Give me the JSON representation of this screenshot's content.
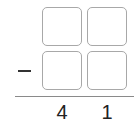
{
  "problem": {
    "operator": "−",
    "operator_name": "minus",
    "top_row": [
      "",
      ""
    ],
    "bottom_row": [
      "",
      ""
    ],
    "result_digits": [
      "4",
      "1"
    ]
  },
  "colors": {
    "box_border": "#a8a8a8",
    "rule": "#8a8a8a",
    "text": "#222222"
  }
}
